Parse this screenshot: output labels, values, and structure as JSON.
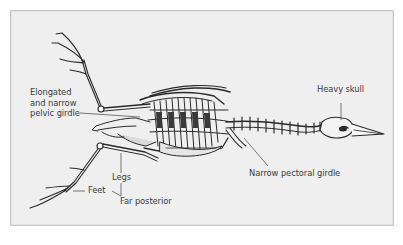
{
  "diagram": {
    "colors": {
      "background": "#efefef",
      "border": "#c9c9c9",
      "ink": "#2a2a2a",
      "label_text": "#3b3b3b",
      "leader_line": "#555555"
    },
    "labels": {
      "pelvic_line1": "Elongated",
      "pelvic_line2": "and narrow",
      "pelvic_line3": "pelvic girdle",
      "heavy_skull": "Heavy skull",
      "legs": "Legs",
      "feet": "Feet",
      "far_posterior": "Far posterior",
      "pectoral_girdle": "Narrow pectoral girdle"
    }
  }
}
